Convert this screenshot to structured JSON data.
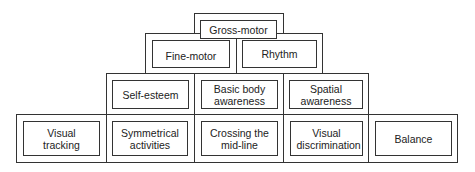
{
  "diagram": {
    "type": "pyramid-hierarchy",
    "levels": [
      {
        "level": 1,
        "items": [
          "Gross-motor"
        ]
      },
      {
        "level": 2,
        "items": [
          "Fine-motor",
          "Rhythm"
        ]
      },
      {
        "level": 3,
        "items": [
          "Self-esteem",
          "Basic body awareness",
          "Spatial awareness"
        ]
      },
      {
        "level": 4,
        "items": [
          "Visual tracking",
          "Symmetrical activities",
          "Crossing the mid-line",
          "Visual discrimination",
          "Balance"
        ]
      }
    ],
    "labels": {
      "gross_motor": "Gross-motor",
      "fine_motor": "Fine-motor",
      "rhythm": "Rhythm",
      "self_esteem": "Self-esteem",
      "basic_body_awareness": "Basic body awareness",
      "spatial_awareness": "Spatial awareness",
      "visual_tracking": "Visual tracking",
      "symmetrical_activities": "Symmetrical activities",
      "crossing_the_mid_line": "Crossing the mid-line",
      "visual_discrimination": "Visual discrimination",
      "balance": "Balance"
    }
  }
}
